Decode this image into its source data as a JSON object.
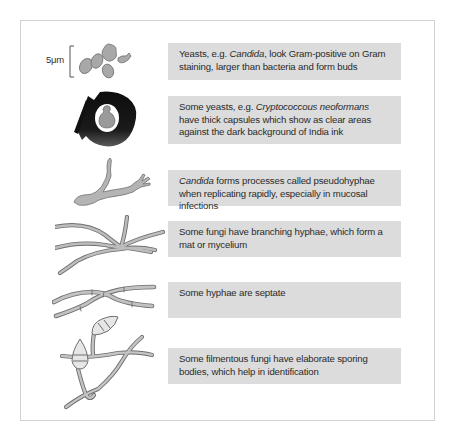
{
  "figure": {
    "scale_bar_label": "5μm",
    "rows": [
      {
        "id": "yeasts",
        "illustration": "yeast-cells-budding",
        "text_parts": [
          {
            "t": "Yeasts, e.g. ",
            "italic": false
          },
          {
            "t": "Candida",
            "italic": true
          },
          {
            "t": ", look Gram-positive on Gram staining, larger than bacteria and form buds",
            "italic": false
          }
        ]
      },
      {
        "id": "capsule",
        "illustration": "india-ink-capsule",
        "text_parts": [
          {
            "t": "Some yeasts, e.g. ",
            "italic": false
          },
          {
            "t": "Cryptococcous neoformans",
            "italic": true
          },
          {
            "t": " have thick capsules which show as clear areas against the dark background of India ink",
            "italic": false
          }
        ]
      },
      {
        "id": "pseudohyphae",
        "illustration": "pseudohyphae",
        "text_parts": [
          {
            "t": "Candida",
            "italic": true
          },
          {
            "t": " forms processes called pseudohyphae when replicating rapidly, especially in mucosal infections",
            "italic": false
          }
        ]
      },
      {
        "id": "branching",
        "illustration": "branching-hyphae",
        "text_parts": [
          {
            "t": "Some fungi have branching hyphae, which form a mat or mycelium",
            "italic": false
          }
        ]
      },
      {
        "id": "septate",
        "illustration": "septate-hyphae",
        "text_parts": [
          {
            "t": "Some hyphae are septate",
            "italic": false
          }
        ]
      },
      {
        "id": "sporing",
        "illustration": "sporing-bodies",
        "text_parts": [
          {
            "t": "Some filmentous fungi have elaborate sporing bodies, which help in identification",
            "italic": false
          }
        ]
      }
    ]
  },
  "colors": {
    "box_fill": "#dcdcdc",
    "frame_border": "#d2d2d2",
    "text": "#2a2a2a",
    "cell_fill": "#a8a8a8",
    "cell_stroke": "#6e6e6e",
    "ink": "#111111"
  }
}
